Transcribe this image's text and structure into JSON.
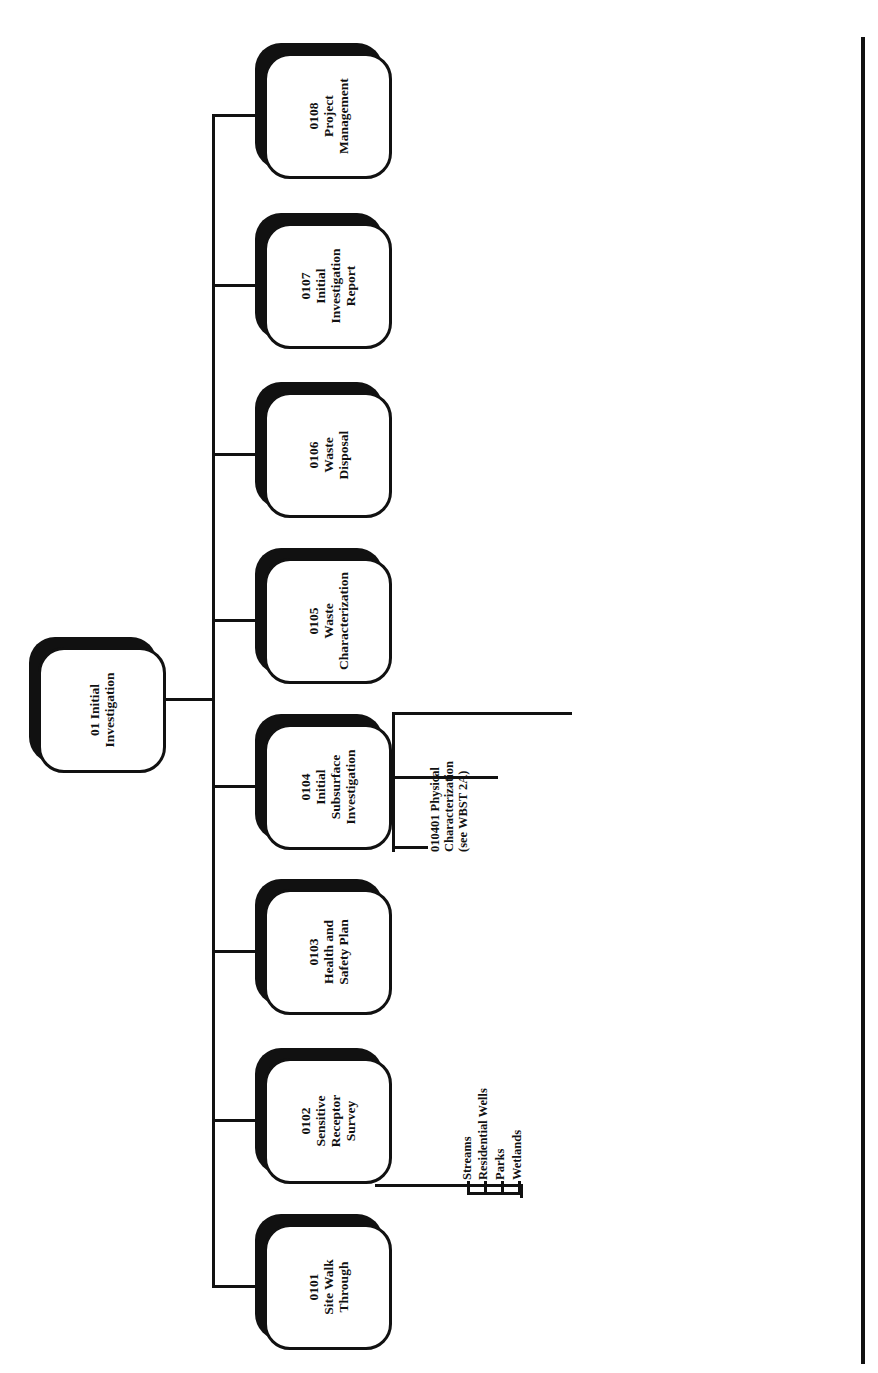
{
  "root": {
    "code": "01",
    "label": "01 Initial\nInvestigation"
  },
  "children": [
    {
      "code": "0101",
      "label": "0101\nSite Walk\nThrough",
      "items": []
    },
    {
      "code": "0102",
      "label": "0102\nSensitive\nReceptor\nSurvey",
      "items": [
        "Streams",
        "Residential Wells",
        "Parks",
        "Wetlands"
      ]
    },
    {
      "code": "0103",
      "label": "0103\nHealth and\nSafety Plan",
      "items": []
    },
    {
      "code": "0104",
      "label": "0104\nInitial\nSubsurface\nInvestigation",
      "items": [
        "010401 Physical\nCharacterization\n(see WBST 2A)",
        "010402 Analytical\nCharacterization\n(see WBST 2A)",
        "010403 Task\nManagement\n(see WBST 2A)"
      ]
    },
    {
      "code": "0105",
      "label": "0105\nWaste\nCharacterization",
      "items": [
        "010501 Drum\nSampling",
        "010502 Laboratory\nAnalysis",
        "010503 Data\nInterpretations"
      ]
    },
    {
      "code": "0106",
      "label": "0106\nWaste\nDisposal",
      "items": [
        "010601\nSubcontractor\nSelection",
        "010602\nTransportation",
        "010603 Disposal"
      ]
    },
    {
      "code": "0107",
      "label": "0107\nInitial\nInvestigation\nReport",
      "items": [
        "010701 Introduction",
        "010702 Field Activities",
        "010703 Results",
        "010704 Summary and Conclusions",
        "010705  Editing /Internal Review",
        "M - 1 Submit to Customer",
        "010706 Customer Review",
        "010707 Revisions",
        "M - 2 Submit to Regulatory Agency",
        "010708 Regulatory Review",
        "M - 3 Regulatory Approval",
        "010709 Task Management"
      ]
    },
    {
      "code": "0108",
      "label": "0108\nProject\nManagement",
      "items": []
    }
  ]
}
